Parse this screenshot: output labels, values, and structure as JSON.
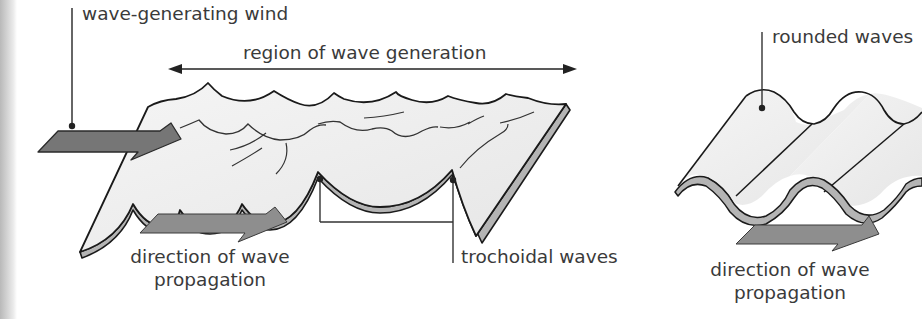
{
  "diagram": {
    "left_panel": {
      "wind_label": "wave-generating wind",
      "region_label": "region of wave generation",
      "trochoidal_label": "trochoidal waves",
      "direction_label_line1": "direction of wave",
      "direction_label_line2": "propagation",
      "icons": [
        "wind-arrow-icon",
        "propagation-arrow-icon",
        "double-headed-arrow-icon"
      ]
    },
    "right_panel": {
      "rounded_label": "rounded waves",
      "direction_label_line1": "direction of wave",
      "direction_label_line2": "propagation",
      "icons": [
        "propagation-arrow-icon"
      ]
    },
    "colors": {
      "arrow_fill": "#7a7a7a",
      "propagation_arrow_fill": "#8e8e8e",
      "sheet_fill": "#efefef",
      "sheet_edge": "#b0b0b0",
      "line": "#1a1a1a",
      "text": "#3a3a3a"
    }
  }
}
